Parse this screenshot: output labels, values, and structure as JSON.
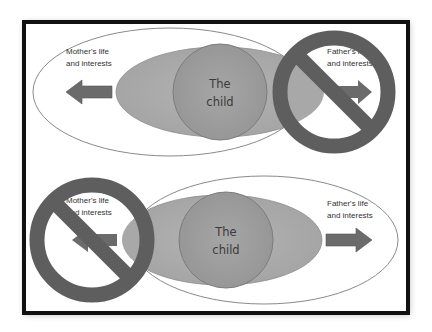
{
  "diagram": {
    "title": "",
    "colors": {
      "frame": "#111111",
      "outer_ellipse_stroke": "#8a8a8a",
      "grey_ellipse": "#a8a8a8",
      "child_circle": "#9a9a9a",
      "arrow": "#6b6b6b",
      "prohibition_sign": "#5e5e5e",
      "text": "#333333"
    },
    "top_panel": {
      "parent_label_line1": "Mother's life",
      "parent_label_line2": "and interests",
      "other_parent_label_line1": "Father's life",
      "other_parent_label_line2": "and interests",
      "child_label_line1": "The",
      "child_label_line2": "child",
      "prohibited_side": "right",
      "prohibition_icon": "no-entry-sign"
    },
    "bottom_panel": {
      "parent_label_line1": "Father's life",
      "parent_label_line2": "and interests",
      "other_parent_label_line1": "Mother's life",
      "other_parent_label_line2": "and interests",
      "child_label_line1": "The",
      "child_label_line2": "child",
      "prohibited_side": "left",
      "prohibition_icon": "no-entry-sign"
    }
  }
}
